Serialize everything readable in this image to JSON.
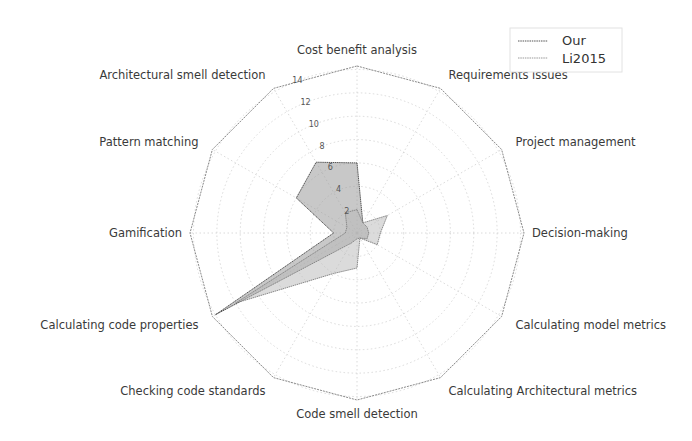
{
  "chart_data": {
    "type": "radar",
    "title": "",
    "categories": [
      "Cost benefit analysis",
      "Requirements issues",
      "Project management",
      "Decision-making",
      "Calculating model metrics",
      "Calculating Architectural metrics",
      "Code smell detection",
      "Checking code standards",
      "Calculating code properties",
      "Gamification",
      "Pattern matching",
      "Architectural smell detection"
    ],
    "series": [
      {
        "name": "Our",
        "values": [
          6,
          1,
          1,
          1,
          1,
          0.5,
          0.5,
          1,
          14,
          2,
          6,
          7
        ],
        "fill": "#9a9a9a",
        "stroke": "#555555",
        "fill_opacity": 0.55
      },
      {
        "name": "Li2015",
        "values": [
          2,
          1,
          3,
          2,
          2,
          0.5,
          3,
          4,
          12,
          1,
          1,
          2
        ],
        "fill": "#b8b8b8",
        "stroke": "#8a8a8a",
        "fill_opacity": 0.5
      }
    ],
    "radial_ticks": [
      2,
      4,
      6,
      8,
      10,
      12,
      14
    ],
    "rlim": [
      0,
      14.3
    ],
    "grid": true,
    "legend_position": "upper right"
  },
  "legend": {
    "items": [
      {
        "label": "Our"
      },
      {
        "label": "Li2015"
      }
    ]
  }
}
